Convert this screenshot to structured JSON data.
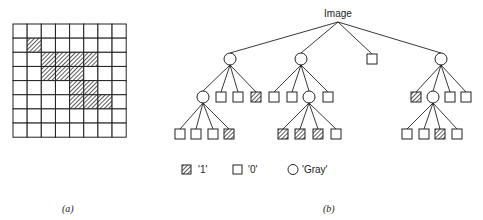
{
  "figure_a": {
    "caption": "(a)",
    "grid": {
      "rows": 8,
      "cols": 8,
      "hatched_cells": [
        [
          1,
          1
        ],
        [
          2,
          2
        ],
        [
          2,
          3
        ],
        [
          2,
          4
        ],
        [
          2,
          5
        ],
        [
          3,
          2
        ],
        [
          3,
          3
        ],
        [
          3,
          4
        ],
        [
          4,
          4
        ],
        [
          4,
          5
        ],
        [
          5,
          4
        ],
        [
          5,
          5
        ],
        [
          5,
          6
        ]
      ]
    }
  },
  "figure_b": {
    "caption": "(b)",
    "root_label": "Image",
    "tree": {
      "type": "root",
      "children": [
        {
          "type": "gray",
          "children": [
            {
              "type": "gray",
              "children": [
                {
                  "type": "0"
                },
                {
                  "type": "0"
                },
                {
                  "type": "0"
                },
                {
                  "type": "1"
                }
              ]
            },
            {
              "type": "0"
            },
            {
              "type": "0"
            },
            {
              "type": "1"
            }
          ]
        },
        {
          "type": "gray",
          "children": [
            {
              "type": "0"
            },
            {
              "type": "0"
            },
            {
              "type": "gray",
              "children": [
                {
                  "type": "1"
                },
                {
                  "type": "1"
                },
                {
                  "type": "1"
                },
                {
                  "type": "0"
                }
              ]
            },
            {
              "type": "0"
            }
          ]
        },
        {
          "type": "0"
        },
        {
          "type": "gray",
          "children": [
            {
              "type": "1"
            },
            {
              "type": "gray",
              "children": [
                {
                  "type": "0"
                },
                {
                  "type": "0"
                },
                {
                  "type": "1"
                },
                {
                  "type": "0"
                }
              ]
            },
            {
              "type": "0"
            },
            {
              "type": "0"
            }
          ]
        }
      ]
    },
    "legend": [
      {
        "symbol": "hatched-square",
        "label": "'1'"
      },
      {
        "symbol": "empty-square",
        "label": "'0'"
      },
      {
        "symbol": "circle",
        "label": "'Gray'"
      }
    ]
  }
}
